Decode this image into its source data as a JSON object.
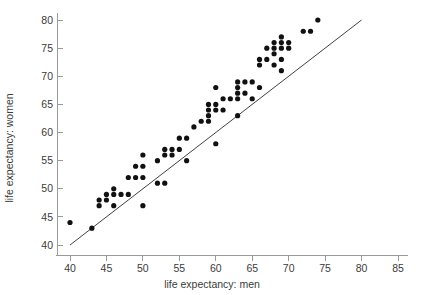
{
  "chart_data": {
    "type": "scatter",
    "title": "",
    "xlabel": "life expectancy: men",
    "ylabel": "life expectancy: women",
    "xlim": [
      37.5,
      87.5
    ],
    "ylim": [
      38.5,
      82.5
    ],
    "xticks": [
      40,
      45,
      50,
      55,
      60,
      65,
      70,
      75,
      80,
      85
    ],
    "yticks": [
      40,
      45,
      50,
      55,
      60,
      65,
      70,
      75,
      80
    ],
    "grid": false,
    "legend": null,
    "marker": "filled-circle",
    "marker_color": "#111111",
    "annotations": [
      {
        "name": "identity-reference-line",
        "type": "line",
        "description": "y = x diagonal reference line",
        "from": [
          40,
          40
        ],
        "to": [
          80,
          80
        ],
        "color": "#2b2b2b"
      }
    ],
    "points": [
      [
        40,
        44
      ],
      [
        43,
        43
      ],
      [
        44,
        48
      ],
      [
        44,
        47
      ],
      [
        45,
        49
      ],
      [
        45,
        48
      ],
      [
        46,
        50
      ],
      [
        46,
        49
      ],
      [
        46,
        47
      ],
      [
        47,
        49
      ],
      [
        48,
        52
      ],
      [
        48,
        49
      ],
      [
        49,
        54
      ],
      [
        49,
        52
      ],
      [
        50,
        56
      ],
      [
        50,
        54
      ],
      [
        50,
        52
      ],
      [
        50,
        47
      ],
      [
        52,
        55
      ],
      [
        52,
        51
      ],
      [
        53,
        56
      ],
      [
        53,
        57
      ],
      [
        53,
        51
      ],
      [
        54,
        57
      ],
      [
        54,
        56
      ],
      [
        55,
        59
      ],
      [
        55,
        57
      ],
      [
        56,
        59
      ],
      [
        56,
        55
      ],
      [
        57,
        61
      ],
      [
        58,
        62
      ],
      [
        59,
        65
      ],
      [
        59,
        64
      ],
      [
        59,
        63
      ],
      [
        59,
        62
      ],
      [
        60,
        68
      ],
      [
        60,
        65
      ],
      [
        60,
        64
      ],
      [
        60,
        58
      ],
      [
        61,
        66
      ],
      [
        61,
        64
      ],
      [
        62,
        66
      ],
      [
        63,
        69
      ],
      [
        63,
        68
      ],
      [
        63,
        67
      ],
      [
        63,
        66
      ],
      [
        63,
        63
      ],
      [
        64,
        69
      ],
      [
        64,
        67
      ],
      [
        65,
        69
      ],
      [
        65,
        66
      ],
      [
        66,
        73
      ],
      [
        66,
        72
      ],
      [
        66,
        68
      ],
      [
        67,
        75
      ],
      [
        67,
        73
      ],
      [
        68,
        76
      ],
      [
        68,
        75
      ],
      [
        68,
        74
      ],
      [
        68,
        72
      ],
      [
        69,
        77
      ],
      [
        69,
        76
      ],
      [
        69,
        75
      ],
      [
        69,
        73
      ],
      [
        69,
        71
      ],
      [
        70,
        76
      ],
      [
        70,
        75
      ],
      [
        72,
        78
      ],
      [
        73,
        78
      ],
      [
        74,
        80
      ]
    ]
  }
}
